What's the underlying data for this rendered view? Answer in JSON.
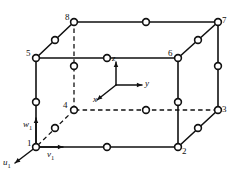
{
  "figure": {
    "kind": "hexahedral-finite-element-diagram",
    "stroke_color": "#111111",
    "node_fill_color": "#ffffff",
    "background_color": "#ffffff",
    "solid_line_width": 1.6,
    "dashed_line_width": 1.3,
    "node_radius": 3.4
  },
  "corner_nodes": [
    {
      "id": "1",
      "label": "1",
      "x": 36,
      "y": 147,
      "label_x": 27,
      "label_y": 139
    },
    {
      "id": "2",
      "label": "2",
      "x": 178,
      "y": 147,
      "label_x": 182,
      "label_y": 147
    },
    {
      "id": "3",
      "label": "3",
      "x": 218,
      "y": 110,
      "label_x": 222,
      "label_y": 105
    },
    {
      "id": "4",
      "label": "4",
      "x": 74,
      "y": 110,
      "label_x": 63,
      "label_y": 101
    },
    {
      "id": "5",
      "label": "5",
      "x": 36,
      "y": 58,
      "label_x": 26,
      "label_y": 49
    },
    {
      "id": "6",
      "label": "6",
      "x": 178,
      "y": 58,
      "label_x": 168,
      "label_y": 49
    },
    {
      "id": "7",
      "label": "7",
      "x": 218,
      "y": 22,
      "label_x": 222,
      "label_y": 16
    },
    {
      "id": "8",
      "label": "8",
      "x": 74,
      "y": 22,
      "label_x": 65,
      "label_y": 13
    }
  ],
  "mid_nodes": [
    {
      "id": "m-1-2",
      "x": 107,
      "y": 147,
      "hidden": false
    },
    {
      "id": "m-2-3",
      "x": 198,
      "y": 128,
      "hidden": false
    },
    {
      "id": "m-3-4",
      "x": 146,
      "y": 110,
      "hidden": true
    },
    {
      "id": "m-4-1",
      "x": 55,
      "y": 128,
      "hidden": true
    },
    {
      "id": "m-5-6",
      "x": 107,
      "y": 58,
      "hidden": false
    },
    {
      "id": "m-6-7",
      "x": 198,
      "y": 40,
      "hidden": false
    },
    {
      "id": "m-7-8",
      "x": 146,
      "y": 22,
      "hidden": false
    },
    {
      "id": "m-8-5",
      "x": 55,
      "y": 40,
      "hidden": false
    },
    {
      "id": "m-1-5",
      "x": 36,
      "y": 102,
      "hidden": false
    },
    {
      "id": "m-2-6",
      "x": 178,
      "y": 102,
      "hidden": false
    },
    {
      "id": "m-3-7",
      "x": 218,
      "y": 66,
      "hidden": false
    },
    {
      "id": "m-4-8",
      "x": 74,
      "y": 66,
      "hidden": true
    }
  ],
  "solid_edges": [
    {
      "id": "e-1-2",
      "from": "1",
      "to": "2"
    },
    {
      "id": "e-2-3",
      "from": "2",
      "to": "3"
    },
    {
      "id": "e-5-6",
      "from": "5",
      "to": "6"
    },
    {
      "id": "e-6-7",
      "from": "6",
      "to": "7"
    },
    {
      "id": "e-7-8",
      "from": "7",
      "to": "8"
    },
    {
      "id": "e-8-5",
      "from": "8",
      "to": "5"
    },
    {
      "id": "e-1-5",
      "from": "1",
      "to": "5"
    },
    {
      "id": "e-2-6",
      "from": "2",
      "to": "6"
    },
    {
      "id": "e-3-7",
      "from": "3",
      "to": "7"
    }
  ],
  "dashed_edges": [
    {
      "id": "e-3-4",
      "from": "3",
      "to": "4"
    },
    {
      "id": "e-4-1",
      "from": "4",
      "to": "1"
    },
    {
      "id": "e-4-8",
      "from": "4",
      "to": "8"
    }
  ],
  "axes": {
    "origin": {
      "x": 116,
      "y": 85
    },
    "items": [
      {
        "id": "z",
        "label": "z",
        "tip_x": 116,
        "tip_y": 62,
        "label_x": 112,
        "label_y": 54
      },
      {
        "id": "y",
        "label": "y",
        "tip_x": 142,
        "tip_y": 85,
        "label_x": 145,
        "label_y": 79
      },
      {
        "id": "x",
        "label": "x",
        "tip_x": 97,
        "tip_y": 100,
        "label_x": 93,
        "label_y": 95
      }
    ]
  },
  "dof_arrows": {
    "node": "1",
    "items": [
      {
        "id": "w1",
        "label": "w",
        "sub": "1",
        "from_x": 36,
        "from_y": 147,
        "tip_x": 36,
        "tip_y": 118,
        "label_x": 23,
        "label_y": 120
      },
      {
        "id": "v1",
        "label": "v",
        "sub": "1",
        "from_x": 36,
        "from_y": 147,
        "tip_x": 63,
        "tip_y": 147,
        "label_x": 47,
        "label_y": 150
      },
      {
        "id": "u1",
        "label": "u",
        "sub": "1",
        "from_x": 36,
        "from_y": 147,
        "tip_x": 15,
        "tip_y": 163,
        "label_x": 3,
        "label_y": 158
      }
    ]
  }
}
